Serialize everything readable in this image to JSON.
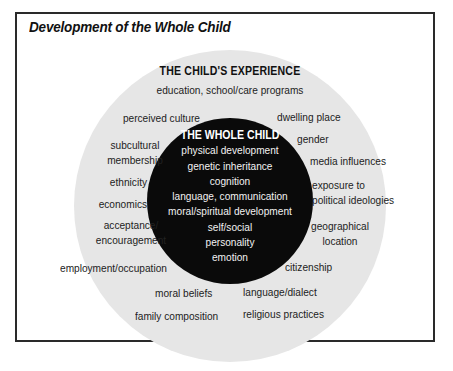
{
  "title": "Development of the Whole Child",
  "outer": {
    "heading": "THE CHILD'S EXPERIENCE",
    "items": [
      "education, school/care programs",
      "perceived culture",
      "dwelling place",
      "subcultural membership",
      "gender",
      "media influences",
      "ethnicity",
      "exposure to political ideologies",
      "economics",
      "acceptance/ encouragement",
      "geographical location",
      "employment/occupation",
      "citizenship",
      "moral beliefs",
      "language/dialect",
      "family composition",
      "religious practices"
    ]
  },
  "inner": {
    "heading": "THE WHOLE CHILD",
    "items": [
      "physical development",
      "genetic inheritance",
      "cognition",
      "language, communication",
      "moral/spiritual development",
      "self/social",
      "personality",
      "emotion"
    ]
  },
  "colors": {
    "outer_circle": "#e6e6e6",
    "inner_circle": "#0a0a0a",
    "frame": "#2a2a2a"
  }
}
